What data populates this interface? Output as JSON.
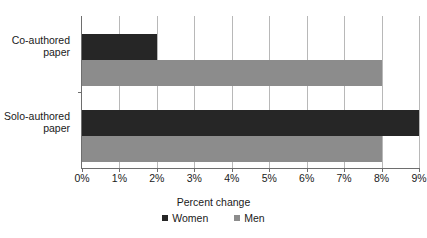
{
  "chart_data": {
    "type": "bar",
    "orientation": "horizontal",
    "title": "",
    "xlabel": "Percent change",
    "ylabel": "",
    "categories": [
      "Co-authored paper",
      "Solo-authored paper"
    ],
    "category_lines": [
      [
        "Co-authored",
        "paper"
      ],
      [
        "Solo-authored",
        "paper"
      ]
    ],
    "series": [
      {
        "name": "Women",
        "color": "#262626",
        "values": [
          2,
          9
        ]
      },
      {
        "name": "Men",
        "color": "#8c8c8c",
        "values": [
          8,
          8
        ]
      }
    ],
    "xlim": [
      0,
      9
    ],
    "xticks": [
      0,
      1,
      2,
      3,
      4,
      5,
      6,
      7,
      8,
      9
    ],
    "xtick_labels": [
      "0%",
      "1%",
      "2%",
      "3%",
      "4%",
      "5%",
      "6%",
      "7%",
      "8%",
      "9%"
    ],
    "grid": "vertical",
    "legend_position": "bottom",
    "legend_entries": [
      "Women",
      "Men"
    ]
  },
  "colors": {
    "women": "#262626",
    "men": "#8c8c8c",
    "gridline": "#b8b8b8",
    "axis": "#6e6e6e",
    "text": "#1a1a1a",
    "background": "#ffffff"
  }
}
